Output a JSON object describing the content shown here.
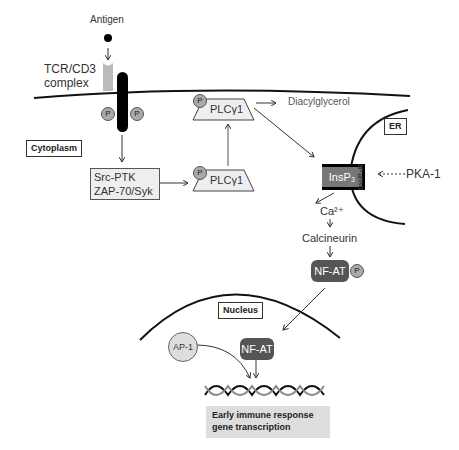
{
  "labels": {
    "antigen": "Antigen",
    "tcr_line1": "TCR/CD3",
    "tcr_line2": "complex",
    "cytoplasm": "Cytoplasm",
    "src_line1": "Src-PTK",
    "src_line2": "ZAP-70/Syk",
    "plc_upper": "PLCγ1",
    "plc_lower": "PLCγ1",
    "diacylglycerol": "Diacylglycerol",
    "er": "ER",
    "insp3": "InsP₃",
    "insp3r": "InsP₃R",
    "pka1": "PKA-1",
    "calcium": "Ca²⁺",
    "calcineurin": "Calcineurin",
    "nfat_cyto": "NF-AT",
    "nucleus": "Nucleus",
    "ap1": "AP-1",
    "nfat_nuc": "NF-AT",
    "gene_line1": "Early immune response",
    "gene_line2": "gene transcription",
    "phospho": "P"
  },
  "colors": {
    "membrane": "#111111",
    "receptor": "#000000",
    "tcr": "#bbbbbb",
    "phospho": "#aaaaaa",
    "nfat": "#555555",
    "insp3": "#777777"
  }
}
